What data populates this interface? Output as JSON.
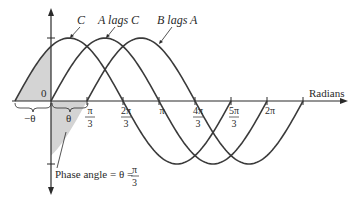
{
  "labels": {
    "curve_c": "C",
    "curve_a": "A lags C",
    "curve_b": "B lags A",
    "axis_x": "Radians",
    "origin": "0",
    "neg_theta": "−θ",
    "theta": "θ",
    "phase_angle": "Phase angle = θ = ",
    "phase_num": "π",
    "phase_den": "3"
  },
  "ticks": [
    {
      "num": "π",
      "den": "3"
    },
    {
      "num": "2π",
      "den": "3"
    },
    {
      "num": "π",
      "den": ""
    },
    {
      "num": "4π",
      "den": "3"
    },
    {
      "num": "5π",
      "den": "3"
    },
    {
      "num": "2π",
      "den": ""
    }
  ],
  "colors": {
    "curve": "#3a3a3a",
    "shade": "#d4d4d4",
    "axis": "#2a2a2a"
  },
  "chart_data": {
    "type": "line",
    "title": "",
    "xlabel": "Radians",
    "ylabel": "",
    "series": [
      {
        "name": "C",
        "function": "sin(x + π/3)",
        "x_range": [
          "-π/3",
          "5π/3"
        ]
      },
      {
        "name": "A lags C",
        "function": "sin(x)",
        "x_range": [
          "0",
          "2π"
        ]
      },
      {
        "name": "B lags A",
        "function": "sin(x - π/3)",
        "x_range": [
          "π/3",
          "7π/3"
        ]
      }
    ],
    "phase_angle": "π/3",
    "x_ticks": [
      "π/3",
      "2π/3",
      "π",
      "4π/3",
      "5π/3",
      "2π"
    ]
  }
}
